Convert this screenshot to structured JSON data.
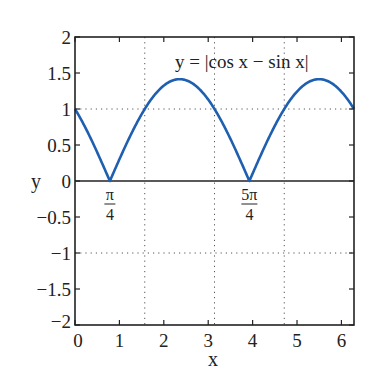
{
  "chart_data": {
    "type": "line",
    "title": "",
    "annotation": "y = |cos x − sin x|",
    "xlabel": "x",
    "ylabel": "y",
    "xlim": [
      0,
      6.2832
    ],
    "ylim": [
      -2,
      2
    ],
    "xticks": [
      0,
      1,
      2,
      3,
      4,
      5,
      6
    ],
    "xtick_labels": [
      "0",
      "1",
      "2",
      "3",
      "4",
      "5",
      "6"
    ],
    "yticks": [
      2,
      1.5,
      1,
      0.5,
      0,
      -0.5,
      -1,
      -1.5,
      -2
    ],
    "ytick_labels": [
      "2",
      "1.5",
      "1",
      "0.5",
      "0",
      "−0.5",
      "−1",
      "−1.5",
      "−2"
    ],
    "grid": {
      "style": "dotted",
      "vertical_at": [
        1.5708,
        3.1416,
        4.7124
      ],
      "horizontal_at": [
        1,
        -1
      ]
    },
    "zero_line": true,
    "special_labels": [
      {
        "x": 0.7854,
        "numerator": "π",
        "denominator": "4"
      },
      {
        "x": 3.927,
        "numerator": "5π",
        "denominator": "4"
      }
    ],
    "series": [
      {
        "name": "y = |cos x - sin x|",
        "color": "#1f5fb0",
        "function": "abs(cos(x) - sin(x))",
        "x": [
          0,
          0.3927,
          0.7854,
          1.1781,
          1.5708,
          1.9635,
          2.3562,
          2.7489,
          3.1416,
          3.5343,
          3.927,
          4.3197,
          4.7124,
          5.1051,
          5.4978,
          5.8905,
          6.2832
        ],
        "values": [
          1.0,
          0.541,
          0.0,
          0.541,
          1.0,
          1.307,
          1.414,
          1.307,
          1.0,
          0.541,
          0.0,
          0.541,
          1.0,
          1.307,
          1.414,
          1.307,
          1.0
        ]
      }
    ]
  },
  "colors": {
    "curve": "#1f5fb0",
    "axes": "#222222",
    "grid": "#555555"
  }
}
